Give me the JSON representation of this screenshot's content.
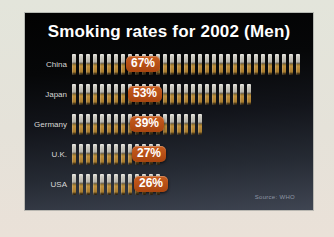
{
  "chart_data": {
    "type": "bar",
    "variant": "pictogram",
    "icon": "cigarette-icon",
    "orientation": "horizontal",
    "title": "Smoking rates for 2002 (Men)",
    "categories": [
      "China",
      "Japan",
      "Germany",
      "U.K.",
      "USA"
    ],
    "values": [
      67,
      53,
      39,
      27,
      26
    ],
    "labels": [
      "67%",
      "53%",
      "39%",
      "27%",
      "26%"
    ],
    "unit": "%",
    "xlim": [
      0,
      100
    ],
    "legend": "none",
    "grid": false,
    "source": "Source: WHO",
    "colors": {
      "badge_orange": "#b5501d",
      "slide_bg_top": "#020202",
      "slide_bg_bottom": "#3f4552",
      "cigarette_filter": "#b8893a",
      "cigarette_paper": "#d6d4cc",
      "title_text": "#ffffff",
      "label_text": "#d8d8d6",
      "photo_border": "#e4e3da"
    }
  }
}
